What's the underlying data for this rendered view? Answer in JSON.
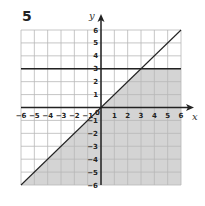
{
  "question_number": "5",
  "chart_data": {
    "type": "area",
    "title": "",
    "xlabel": "x",
    "ylabel": "y",
    "xlim": [
      -6,
      6
    ],
    "ylim": [
      -6,
      6
    ],
    "grid": true,
    "x_ticks": [
      "-6",
      "-5",
      "-4",
      "-3",
      "-2",
      "-1",
      "0",
      "1",
      "2",
      "3",
      "4",
      "5",
      "6"
    ],
    "y_ticks": [
      "-6",
      "-5",
      "-4",
      "-3",
      "-2",
      "-1",
      "1",
      "2",
      "3",
      "4",
      "5",
      "6"
    ],
    "lines": [
      {
        "name": "y = x",
        "points": [
          [
            -6,
            -6
          ],
          [
            6,
            6
          ]
        ]
      },
      {
        "name": "y = 3",
        "points": [
          [
            -6,
            3
          ],
          [
            6,
            3
          ]
        ]
      }
    ],
    "shaded_region": {
      "description": "y <= x and y <= 3",
      "vertices": [
        [
          -6,
          -6
        ],
        [
          0,
          0
        ],
        [
          3,
          3
        ],
        [
          6,
          3
        ],
        [
          6,
          -6
        ]
      ],
      "color": "#d4d4d4"
    },
    "colors": {
      "grid_line": "#b8b8b8",
      "axis": "#222222",
      "boundary_line": "#222222",
      "shade": "#d4d4d4"
    }
  }
}
